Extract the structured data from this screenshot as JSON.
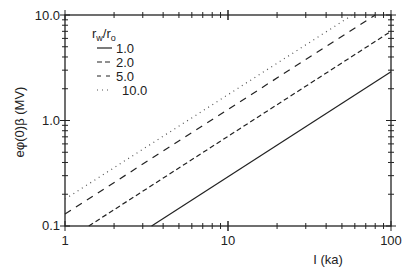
{
  "chart_data": {
    "type": "line",
    "title": "",
    "xlabel": "I (ka)",
    "ylabel": "eφ(0)β (MV)",
    "xscale": "log",
    "yscale": "log",
    "xlim": [
      1,
      100
    ],
    "ylim": [
      0.1,
      10.0
    ],
    "xticks": [
      "1",
      "10",
      "100"
    ],
    "yticks": [
      "0.1",
      "1.0",
      "10.0"
    ],
    "grid": false,
    "legend": {
      "title": "r_w/r_o",
      "position": "upper-left",
      "entries": [
        "1.0",
        "2.0",
        "5.0",
        "10.0"
      ]
    },
    "series": [
      {
        "name": "1.0",
        "style": "solid",
        "x": [
          3.4,
          100
        ],
        "y": [
          0.1,
          2.9
        ]
      },
      {
        "name": "2.0",
        "style": "dashed",
        "x": [
          1.4,
          100
        ],
        "y": [
          0.1,
          7.0
        ]
      },
      {
        "name": "5.0",
        "style": "long-dashed",
        "x": [
          1,
          80
        ],
        "y": [
          0.13,
          10.0
        ]
      },
      {
        "name": "10.0",
        "style": "dotted",
        "x": [
          1,
          58
        ],
        "y": [
          0.18,
          10.0
        ]
      }
    ]
  },
  "axes": {
    "x_ticks": [
      "1",
      "10",
      "100"
    ],
    "y_ticks": [
      "0.1",
      "1.0",
      "10.0"
    ],
    "xlabel": "I (ka)",
    "ylabel": "eφ(0)β (MV)"
  },
  "legend": {
    "title_main": "r",
    "title_sub1": "w",
    "title_slash": "/r",
    "title_sub2": "o",
    "entries": [
      "1.0",
      "2.0",
      "5.0",
      "10.0"
    ]
  }
}
